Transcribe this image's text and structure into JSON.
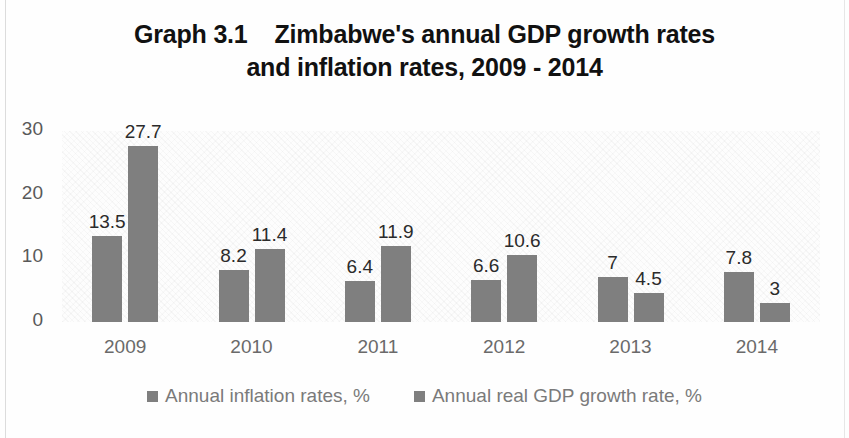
{
  "chart_data": {
    "type": "bar",
    "title": "Graph 3.1    Zimbabwe's annual GDP growth rates and inflation rates, 2009 - 2014",
    "title_line1": "Graph 3.1    Zimbabwe's annual GDP growth rates",
    "title_line2": "and inflation rates, 2009 - 2014",
    "xlabel": "",
    "ylabel": "",
    "ylim": [
      0,
      30
    ],
    "yticks": [
      "0",
      "10",
      "20",
      "30"
    ],
    "ytick_values": [
      0,
      10,
      20,
      30
    ],
    "grid": false,
    "legend_position": "bottom",
    "bar_color": "#7f7f7f",
    "categories": [
      "2009",
      "2010",
      "2011",
      "2012",
      "2013",
      "2014"
    ],
    "series": [
      {
        "name": "Annual inflation rates, %",
        "values": [
          13.5,
          8.2,
          6.4,
          6.6,
          7,
          7.8
        ],
        "labels": [
          "13.5",
          "8.2",
          "6.4",
          "6.6",
          "7",
          "7.8"
        ],
        "color": "#7f7f7f"
      },
      {
        "name": "Annual real GDP growth rate, %",
        "values": [
          27.7,
          11.4,
          11.9,
          10.6,
          4.5,
          3
        ],
        "labels": [
          "27.7",
          "11.4",
          "11.9",
          "10.6",
          "4.5",
          "3"
        ],
        "color": "#7f7f7f"
      }
    ]
  },
  "legend": {
    "items": [
      {
        "label": "Annual inflation rates, %",
        "swatch": "legend-swatch-inflation"
      },
      {
        "label": "Annual real GDP growth rate, %",
        "swatch": "legend-swatch-gdp"
      }
    ]
  }
}
